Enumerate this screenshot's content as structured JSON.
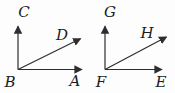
{
  "figure": {
    "type": "geometry-diagram",
    "background": "#fdfdfd",
    "line_color": "#2e2e2e",
    "label_color": "#1c1c1c",
    "diagrams": [
      {
        "vertex_label": "B",
        "rays": [
          {
            "to_label": "C",
            "direction": "up"
          },
          {
            "to_label": "D",
            "direction": "up-right"
          },
          {
            "to_label": "A",
            "direction": "right"
          }
        ]
      },
      {
        "vertex_label": "F",
        "rays": [
          {
            "to_label": "G",
            "direction": "up"
          },
          {
            "to_label": "H",
            "direction": "up-right"
          },
          {
            "to_label": "E",
            "direction": "right"
          }
        ]
      }
    ]
  }
}
